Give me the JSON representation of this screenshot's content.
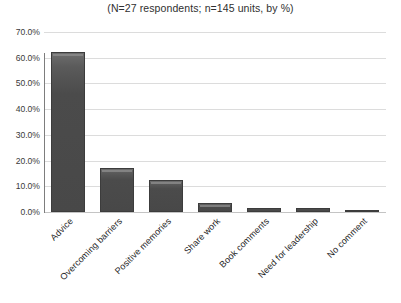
{
  "chart_data": {
    "type": "bar",
    "title": "(N=27 respondents; n=145 units, by %)",
    "xlabel": "",
    "ylabel": "",
    "categories": [
      "Advice",
      "Overcoming barriers",
      "Positive memories",
      "Share work",
      "Book comments",
      "Need for leadership",
      "No comment"
    ],
    "values": [
      62.1,
      17.2,
      12.4,
      3.4,
      1.4,
      1.4,
      0.7
    ],
    "value_labels": [
      "62.1%",
      "17.2%",
      "12.4%",
      "3.4%",
      "1.4%",
      "1.4%",
      "0.7%"
    ],
    "ylim": [
      0,
      70
    ],
    "ytick_values": [
      0,
      10,
      20,
      30,
      40,
      50,
      60,
      70
    ],
    "ytick_labels": [
      "0.0%",
      "10.0%",
      "20.0%",
      "30.0%",
      "40.0%",
      "50.0%",
      "60.0%",
      "70.0%"
    ],
    "grid": "horizontal",
    "legend": "none",
    "series_color": "#4b4b4b",
    "gridline_color": "#dcdcdc",
    "axis_color": "#7d7d7d",
    "label_rotation_degrees": -45
  },
  "yticks": [
    {
      "label": "70.0%",
      "value": 70
    },
    {
      "label": "60.0%",
      "value": 60
    },
    {
      "label": "50.0%",
      "value": 50
    },
    {
      "label": "40.0%",
      "value": 40
    },
    {
      "label": "30.0%",
      "value": 30
    },
    {
      "label": "20.0%",
      "value": 20
    },
    {
      "label": "10.0%",
      "value": 10
    },
    {
      "label": "0.0%",
      "value": 0
    }
  ],
  "bars": [
    {
      "label": "Advice",
      "value": 62.1
    },
    {
      "label": "Overcoming barriers",
      "value": 17.2
    },
    {
      "label": "Positive memories",
      "value": 12.4
    },
    {
      "label": "Share work",
      "value": 3.4
    },
    {
      "label": "Book comments",
      "value": 1.4
    },
    {
      "label": "Need for leadership",
      "value": 1.4
    },
    {
      "label": "No comment",
      "value": 0.7
    }
  ]
}
